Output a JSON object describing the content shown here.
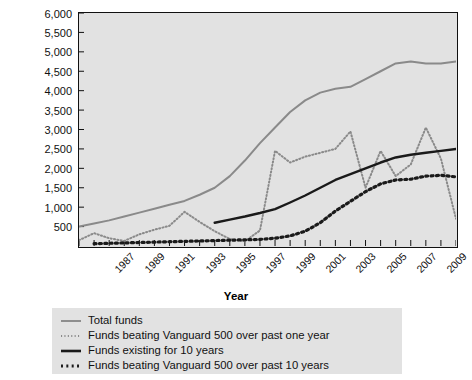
{
  "chart_data": {
    "type": "line",
    "title": "",
    "xlabel": "Year",
    "ylabel": "Number",
    "xlim": [
      1986,
      2011
    ],
    "ylim": [
      0,
      6000
    ],
    "grid": false,
    "legend_position": "bottom",
    "y_ticks": [
      500,
      1000,
      1500,
      2000,
      2500,
      3000,
      3500,
      4000,
      4500,
      5000,
      5500,
      6000
    ],
    "y_tick_labels": [
      "500",
      "1,000",
      "1,500",
      "2,000",
      "2,500",
      "3,000",
      "3,500",
      "4,000",
      "4,500",
      "5,000",
      "5,500",
      "6,000"
    ],
    "x_ticks": [
      1986,
      1987,
      1988,
      1989,
      1990,
      1991,
      1992,
      1993,
      1994,
      1995,
      1996,
      1997,
      1998,
      1999,
      2000,
      2001,
      2002,
      2003,
      2004,
      2005,
      2006,
      2007,
      2008,
      2009,
      2010,
      2011
    ],
    "x_tick_labels": [
      "1987",
      "1989",
      "1991",
      "1993",
      "1995",
      "1997",
      "1999",
      "2001",
      "2003",
      "2005",
      "2007",
      "2009",
      "2011"
    ],
    "x_tick_label_years": [
      1987,
      1989,
      1991,
      1993,
      1995,
      1997,
      1999,
      2001,
      2003,
      2005,
      2007,
      2009,
      2011
    ],
    "series": [
      {
        "name": "Total funds",
        "style": "solid",
        "color": "#8a8a8a",
        "width": 2.0,
        "x": [
          1986,
          1987,
          1988,
          1989,
          1990,
          1991,
          1992,
          1993,
          1994,
          1995,
          1996,
          1997,
          1998,
          1999,
          2000,
          2001,
          2002,
          2003,
          2004,
          2005,
          2006,
          2007,
          2008,
          2009,
          2010,
          2011
        ],
        "values": [
          500,
          580,
          660,
          760,
          860,
          960,
          1060,
          1160,
          1320,
          1500,
          1800,
          2200,
          2650,
          3050,
          3450,
          3750,
          3950,
          4050,
          4100,
          4300,
          4500,
          4700,
          4750,
          4700,
          4700,
          4750
        ]
      },
      {
        "name": "Funds beating Vanguard 500 over past one year",
        "style": "dotted",
        "color": "#8a8a8a",
        "width": 2.0,
        "x": [
          1986,
          1987,
          1988,
          1989,
          1990,
          1991,
          1992,
          1993,
          1994,
          1995,
          1996,
          1997,
          1998,
          1999,
          2000,
          2001,
          2002,
          2003,
          2004,
          2005,
          2006,
          2007,
          2008,
          2009,
          2010,
          2011
        ],
        "values": [
          150,
          330,
          200,
          130,
          300,
          420,
          520,
          880,
          620,
          380,
          180,
          120,
          400,
          2450,
          2150,
          2300,
          2400,
          2500,
          2950,
          1500,
          2450,
          1800,
          2100,
          3050,
          2250,
          700
        ]
      },
      {
        "name": "Funds existing for 10 years",
        "style": "solid",
        "color": "#1a1a1a",
        "width": 2.4,
        "x": [
          1995,
          1996,
          1997,
          1998,
          1999,
          2000,
          2001,
          2002,
          2003,
          2004,
          2005,
          2006,
          2007,
          2008,
          2009,
          2010,
          2011
        ],
        "values": [
          600,
          680,
          760,
          850,
          950,
          1120,
          1300,
          1500,
          1700,
          1850,
          2000,
          2150,
          2280,
          2350,
          2400,
          2450,
          2500
        ]
      },
      {
        "name": "Funds beating Vanguard 500 over past 10 years",
        "style": "dotted-bold",
        "color": "#1a1a1a",
        "width": 3.2,
        "x": [
          1987,
          1988,
          1989,
          1990,
          1991,
          1992,
          1993,
          1994,
          1995,
          1996,
          1997,
          1998,
          1999,
          2000,
          2001,
          2002,
          2003,
          2004,
          2005,
          2006,
          2007,
          2008,
          2009,
          2010,
          2011
        ],
        "values": [
          60,
          70,
          80,
          90,
          100,
          110,
          120,
          130,
          140,
          150,
          160,
          170,
          200,
          260,
          380,
          600,
          900,
          1150,
          1400,
          1600,
          1700,
          1720,
          1800,
          1820,
          1780
        ]
      }
    ]
  },
  "axes": {
    "y_title": "Number",
    "x_title": "Year"
  },
  "legend": {
    "items": [
      {
        "label": "Total funds",
        "style": "solid",
        "color": "#8a8a8a"
      },
      {
        "label": "Funds beating Vanguard 500 over past one year",
        "style": "dotted",
        "color": "#8a8a8a"
      },
      {
        "label": "Funds existing for 10 years",
        "style": "solid",
        "color": "#1a1a1a"
      },
      {
        "label": "Funds beating Vanguard 500 over past 10 years",
        "style": "dotted-bold",
        "color": "#1a1a1a"
      }
    ]
  },
  "colors": {
    "plot_background": "#e2e2e2",
    "legend_background": "#e2e2e2",
    "frame": "#111111",
    "gray_series": "#8a8a8a",
    "black_series": "#1a1a1a"
  }
}
